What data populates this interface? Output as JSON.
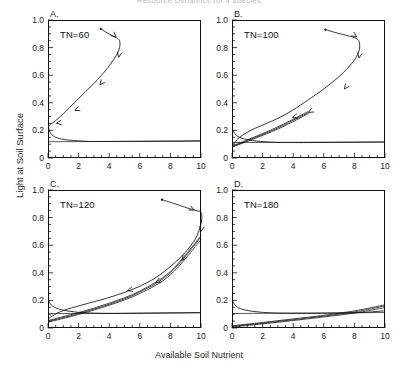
{
  "figure": {
    "title_faint": "Resource Dynamics for 4 species",
    "ylabel": "Light at Soil Surface",
    "xlabel": "Available Soil Nutrient"
  },
  "axes": {
    "y_ticks": [
      "0",
      "0.2",
      "0.4",
      "0.6",
      "0.8",
      "1.0"
    ],
    "y_tick_values": [
      0,
      0.2,
      0.4,
      0.6,
      0.8,
      1.0
    ],
    "x_ticks": [
      "0",
      "2",
      "4",
      "6",
      "8",
      "10"
    ],
    "x_tick_values": [
      0,
      2,
      4,
      6,
      8,
      10
    ],
    "xlim": [
      0,
      10
    ],
    "ylim": [
      0,
      1.0
    ],
    "x_minor_step": 0.5,
    "y_minor_step": 0.05,
    "grid": false
  },
  "panels": [
    {
      "letter": "A.",
      "tag": "TN=60"
    },
    {
      "letter": "B.",
      "tag": "TN=100"
    },
    {
      "letter": "C.",
      "tag": "TN=120"
    },
    {
      "letter": "D.",
      "tag": "TN=180"
    }
  ],
  "chart_data": {
    "type": "line",
    "title": "Resource Dynamics for 4 species",
    "xlabel": "Available Soil Nutrient",
    "ylabel": "Light at Soil Surface",
    "xlim": [
      0,
      10
    ],
    "ylim": [
      0,
      1.0
    ],
    "grid": false,
    "legend": null,
    "panels": [
      {
        "letter": "A.",
        "label": "TN=60",
        "annotation": "TN=60",
        "series": [
          {
            "name": "trajectory",
            "comment": "phase-plane trajectory, arrows show direction of time toward equilibrium near (0.05, 0.23)",
            "x": [
              3.45,
              3.9,
              4.3,
              4.6,
              4.7,
              4.68,
              4.55,
              4.3,
              3.95,
              3.5,
              3.0,
              2.45,
              1.9,
              1.4,
              1.0,
              0.65,
              0.4,
              0.22,
              0.12,
              0.06,
              0.05
            ],
            "y": [
              0.935,
              0.905,
              0.88,
              0.862,
              0.84,
              0.8,
              0.76,
              0.715,
              0.66,
              0.6,
              0.54,
              0.48,
              0.42,
              0.365,
              0.32,
              0.285,
              0.262,
              0.248,
              0.24,
              0.234,
              0.23
            ],
            "arrows": [
              {
                "x": 4.45,
                "y": 0.878,
                "angle": 40
              },
              {
                "x": 4.62,
                "y": 0.73,
                "angle": 100
              },
              {
                "x": 3.4,
                "y": 0.53,
                "angle": 128
              },
              {
                "x": 1.75,
                "y": 0.345,
                "angle": 158
              },
              {
                "x": 0.55,
                "y": 0.252,
                "angle": 172
              }
            ],
            "start_point": {
              "x": 3.45,
              "y": 0.935
            }
          },
          {
            "name": "light-decay-curve",
            "comment": "steeply falling curve from (0,0.22) flattening to y~0.12 plateau",
            "x": [
              0.02,
              0.08,
              0.18,
              0.32,
              0.5,
              0.75,
              1.05,
              1.45,
              1.9,
              2.35,
              2.75,
              3.3,
              4.2,
              5.5,
              7.0,
              8.6,
              10.0
            ],
            "y": [
              0.225,
              0.2,
              0.178,
              0.162,
              0.15,
              0.141,
              0.134,
              0.129,
              0.125,
              0.122,
              0.12,
              0.12,
              0.12,
              0.121,
              0.122,
              0.123,
              0.125
            ]
          },
          {
            "name": "equilibrium-line",
            "comment": "near-horizontal line at y~0.12 across full width",
            "x": [
              0.0,
              10.0
            ],
            "y": [
              0.118,
              0.122
            ]
          }
        ]
      },
      {
        "letter": "B.",
        "label": "TN=100",
        "annotation": "TN=100",
        "series": [
          {
            "name": "trajectory",
            "comment": "larger loop reaching x~8.3, converging down-left to origin-side equilibrium",
            "x": [
              6.1,
              6.9,
              7.6,
              8.1,
              8.3,
              8.35,
              8.25,
              8.0,
              7.55,
              7.0,
              6.4,
              5.75,
              5.1,
              4.5,
              3.95,
              3.4,
              2.9,
              2.4,
              1.95,
              1.5,
              1.1,
              0.75,
              0.45,
              0.22,
              0.1
            ],
            "y": [
              0.93,
              0.905,
              0.885,
              0.868,
              0.845,
              0.805,
              0.76,
              0.71,
              0.65,
              0.59,
              0.535,
              0.48,
              0.43,
              0.385,
              0.345,
              0.31,
              0.282,
              0.258,
              0.236,
              0.215,
              0.193,
              0.17,
              0.145,
              0.118,
              0.098
            ],
            "arrows": [
              {
                "x": 8.15,
                "y": 0.878,
                "angle": 35
              },
              {
                "x": 8.3,
                "y": 0.725,
                "angle": 100
              },
              {
                "x": 7.35,
                "y": 0.5,
                "angle": 126
              },
              {
                "x": 5.0,
                "y": 0.33,
                "angle": 150
              },
              {
                "x": 3.95,
                "y": 0.295,
                "angle": 166
              }
            ],
            "start_point": {
              "x": 6.1,
              "y": 0.93
            }
          },
          {
            "name": "light-decay-curve",
            "x": [
              0.02,
              0.1,
              0.22,
              0.4,
              0.65,
              0.95,
              1.35,
              1.85,
              2.4,
              3.0,
              3.8,
              5.0,
              6.5,
              8.0,
              10.0
            ],
            "y": [
              0.215,
              0.192,
              0.172,
              0.155,
              0.143,
              0.134,
              0.126,
              0.12,
              0.116,
              0.113,
              0.112,
              0.112,
              0.113,
              0.114,
              0.116
            ]
          },
          {
            "name": "nutrient-isocline-bundle",
            "comment": "several near-coincident rising lines from (0,0.08) to ~(5,0.33)",
            "lines": [
              {
                "x": [
                  0.0,
                  1.5,
                  3.0,
                  4.2,
                  5.0
                ],
                "y": [
                  0.082,
                  0.148,
                  0.218,
                  0.285,
                  0.33
                ]
              },
              {
                "x": [
                  0.0,
                  1.5,
                  3.0,
                  4.2,
                  5.0
                ],
                "y": [
                  0.078,
                  0.142,
                  0.21,
                  0.276,
                  0.322
                ]
              },
              {
                "x": [
                  0.0,
                  1.5,
                  3.0,
                  4.2,
                  5.0
                ],
                "y": [
                  0.086,
                  0.154,
                  0.226,
                  0.292,
                  0.338
                ]
              }
            ]
          },
          {
            "name": "equilibrium-line",
            "x": [
              0.0,
              10.0
            ],
            "y": [
              0.112,
              0.116
            ]
          }
        ]
      },
      {
        "letter": "C.",
        "label": "TN=120",
        "annotation": "TN=120",
        "series": [
          {
            "name": "trajectory",
            "comment": "trajectory enters from left at y~0.93, turns at x~10 and descends along right edge",
            "x": [
              7.45,
              8.3,
              9.1,
              9.7,
              10.0,
              10.05,
              9.95,
              9.7,
              9.35,
              8.95,
              8.5,
              8.05,
              7.55,
              7.05,
              6.5,
              5.95,
              5.4,
              4.85,
              4.3,
              3.75,
              3.2,
              2.65,
              2.1,
              1.55,
              1.05,
              0.6,
              0.25,
              0.05
            ],
            "y": [
              0.93,
              0.9,
              0.87,
              0.85,
              0.84,
              0.79,
              0.73,
              0.66,
              0.6,
              0.545,
              0.495,
              0.45,
              0.405,
              0.365,
              0.33,
              0.3,
              0.275,
              0.252,
              0.232,
              0.213,
              0.196,
              0.18,
              0.163,
              0.146,
              0.128,
              0.108,
              0.085,
              0.07
            ],
            "arrows": [
              {
                "x": 9.55,
                "y": 0.855,
                "angle": 25
              },
              {
                "x": 10.0,
                "y": 0.7,
                "angle": 100
              },
              {
                "x": 8.75,
                "y": 0.49,
                "angle": 128
              },
              {
                "x": 7.05,
                "y": 0.33,
                "angle": 152
              },
              {
                "x": 5.2,
                "y": 0.272,
                "angle": 166
              }
            ],
            "start_point": {
              "x": 7.45,
              "y": 0.93
            }
          },
          {
            "name": "light-decay-curve",
            "x": [
              0.02,
              0.1,
              0.22,
              0.42,
              0.7,
              1.05,
              1.5,
              2.05,
              2.7,
              3.4,
              4.3,
              5.5,
              7.0,
              8.5,
              10.0
            ],
            "y": [
              0.21,
              0.186,
              0.166,
              0.15,
              0.138,
              0.128,
              0.12,
              0.113,
              0.109,
              0.106,
              0.105,
              0.106,
              0.108,
              0.11,
              0.112
            ]
          },
          {
            "name": "nutrient-isocline-bundle",
            "comment": "fan of near-coincident rising lines from (0,0.045) up to ~(10,0.66)",
            "lines": [
              {
                "x": [
                  0.0,
                  2.0,
                  4.0,
                  6.0,
                  8.0,
                  10.0
                ],
                "y": [
                  0.048,
                  0.105,
                  0.172,
                  0.26,
                  0.4,
                  0.66
                ]
              },
              {
                "x": [
                  0.0,
                  2.0,
                  4.0,
                  6.0,
                  8.0,
                  10.0
                ],
                "y": [
                  0.042,
                  0.098,
                  0.165,
                  0.25,
                  0.385,
                  0.64
                ]
              },
              {
                "x": [
                  0.0,
                  2.0,
                  4.0,
                  6.0,
                  8.0,
                  10.0
                ],
                "y": [
                  0.054,
                  0.112,
                  0.18,
                  0.268,
                  0.41,
                  0.668
                ]
              }
            ]
          },
          {
            "name": "equilibrium-line",
            "x": [
              0.0,
              10.0
            ],
            "y": [
              0.104,
              0.11
            ]
          }
        ]
      },
      {
        "letter": "D.",
        "label": "TN=180",
        "annotation": "TN=180",
        "series": [
          {
            "name": "light-decay-curve",
            "comment": "no large loop in this panel; only decaying curve plus rising bundle",
            "x": [
              0.02,
              0.1,
              0.22,
              0.42,
              0.7,
              1.05,
              1.5,
              2.05,
              2.7,
              3.4,
              4.3,
              5.5,
              7.0,
              8.5,
              10.0
            ],
            "y": [
              0.205,
              0.182,
              0.162,
              0.147,
              0.135,
              0.126,
              0.119,
              0.113,
              0.109,
              0.107,
              0.106,
              0.106,
              0.108,
              0.112,
              0.125
            ]
          },
          {
            "name": "nutrient-isocline-bundle",
            "comment": "shallow rising lines from (0,0.01) to ~(10,0.16)",
            "lines": [
              {
                "x": [
                  0.0,
                  2.0,
                  4.0,
                  6.0,
                  8.0,
                  10.0
                ],
                "y": [
                  0.012,
                  0.035,
                  0.06,
                  0.086,
                  0.116,
                  0.16
                ]
              },
              {
                "x": [
                  0.0,
                  2.0,
                  4.0,
                  6.0,
                  8.0,
                  10.0
                ],
                "y": [
                  0.008,
                  0.03,
                  0.054,
                  0.08,
                  0.108,
                  0.148
                ]
              },
              {
                "x": [
                  0.0,
                  2.0,
                  4.0,
                  6.0,
                  8.0,
                  10.0
                ],
                "y": [
                  0.016,
                  0.04,
                  0.066,
                  0.092,
                  0.124,
                  0.168
                ]
              }
            ]
          },
          {
            "name": "equilibrium-line",
            "x": [
              0.0,
              10.0
            ],
            "y": [
              0.105,
              0.112
            ]
          }
        ]
      }
    ]
  }
}
